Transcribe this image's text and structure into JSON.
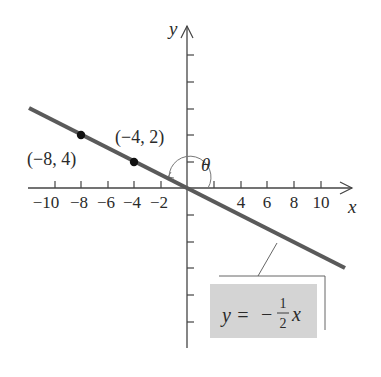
{
  "diagram": {
    "type": "coordinate-plane-line",
    "axes": {
      "x_label": "x",
      "y_label": "y",
      "x_tick_labels": [
        "−10",
        "−8",
        "−6",
        "−4",
        "−2",
        "4",
        "6",
        "8",
        "10"
      ],
      "tick_step": 2
    },
    "line": {
      "equation_lhs": "y =",
      "equation_sign": "−",
      "equation_numerator": "1",
      "equation_denominator": "2",
      "equation_var": "x",
      "slope": -0.5,
      "color": "#555555"
    },
    "points": [
      {
        "label": "(−8, 4)",
        "x": -8,
        "y": 4
      },
      {
        "label": "(−4, 2)",
        "x": -4,
        "y": 2
      }
    ],
    "angle_label": "θ",
    "label_box_color": "#d4d4d4"
  }
}
